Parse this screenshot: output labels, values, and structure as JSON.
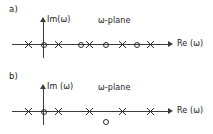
{
  "figure": {
    "caption_a": "a)",
    "caption_b": "b)"
  },
  "panels": [
    {
      "id": "panel-a",
      "label": "a)",
      "plane_label": "ω-plane",
      "imaginary_axis_label": "Im(ω)",
      "real_axis_label": "Re (ω)",
      "markers": [
        {
          "type": "cross",
          "symbol": "x",
          "x": 28,
          "y": 44
        },
        {
          "type": "circle",
          "symbol": "o",
          "x": 43,
          "y": 44
        },
        {
          "type": "cross",
          "symbol": "x",
          "x": 58,
          "y": 44
        },
        {
          "type": "circle",
          "symbol": "o",
          "x": 80,
          "y": 44
        },
        {
          "type": "cross",
          "symbol": "x",
          "x": 89,
          "y": 44
        },
        {
          "type": "circle",
          "symbol": "o",
          "x": 105,
          "y": 44
        },
        {
          "type": "cross",
          "symbol": "x",
          "x": 122,
          "y": 44
        },
        {
          "type": "circle",
          "symbol": "o",
          "x": 136,
          "y": 44
        },
        {
          "type": "cross",
          "symbol": "x",
          "x": 150,
          "y": 44
        }
      ]
    },
    {
      "id": "panel-b",
      "label": "b)",
      "plane_label": "ω-plane",
      "imaginary_axis_label": "Im (ω)",
      "real_axis_label": "Re (ω)",
      "markers": [
        {
          "type": "cross",
          "symbol": "x",
          "x": 28,
          "y": 44
        },
        {
          "type": "circle",
          "symbol": "o",
          "x": 43,
          "y": 44
        },
        {
          "type": "cross",
          "symbol": "x",
          "x": 58,
          "y": 44
        },
        {
          "type": "cross",
          "symbol": "x",
          "x": 89,
          "y": 44
        },
        {
          "type": "cross",
          "symbol": "x",
          "x": 122,
          "y": 44
        },
        {
          "type": "cross",
          "symbol": "x",
          "x": 150,
          "y": 44
        },
        {
          "type": "circle",
          "symbol": "o",
          "x": 105,
          "y": 54
        }
      ]
    }
  ],
  "geometry": {
    "axis_color": "#3a3a3a",
    "marker_color": "#2b2b2b",
    "background": "#ffffff",
    "axis_y": 44,
    "axis_x_start": 12,
    "axis_x_end": 168,
    "origin_x": 43,
    "axis_v_top": 20,
    "axis_v_bottom": 58
  }
}
